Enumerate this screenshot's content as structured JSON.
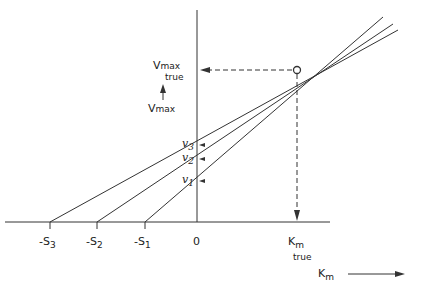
{
  "diagram": {
    "type": "direct linear plot",
    "x_axis": {
      "label": "K",
      "label_sub": "m",
      "origin": "0",
      "ticks": [
        {
          "label": "-S",
          "sub": "3"
        },
        {
          "label": "-S",
          "sub": "2"
        },
        {
          "label": "-S",
          "sub": "1"
        }
      ]
    },
    "y_axis": {
      "label": "V",
      "label_sub": "max",
      "ticks": [
        {
          "label": "v",
          "sub": "3"
        },
        {
          "label": "v",
          "sub": "2"
        },
        {
          "label": "v",
          "sub": "1"
        }
      ]
    },
    "intersection": {
      "vmax_label": "V",
      "vmax_sub": "max",
      "vmax_true": "true",
      "km_label": "K",
      "km_sub": "m",
      "km_true": "true"
    },
    "colors": {
      "line": "#333333",
      "background": "#ffffff"
    }
  }
}
